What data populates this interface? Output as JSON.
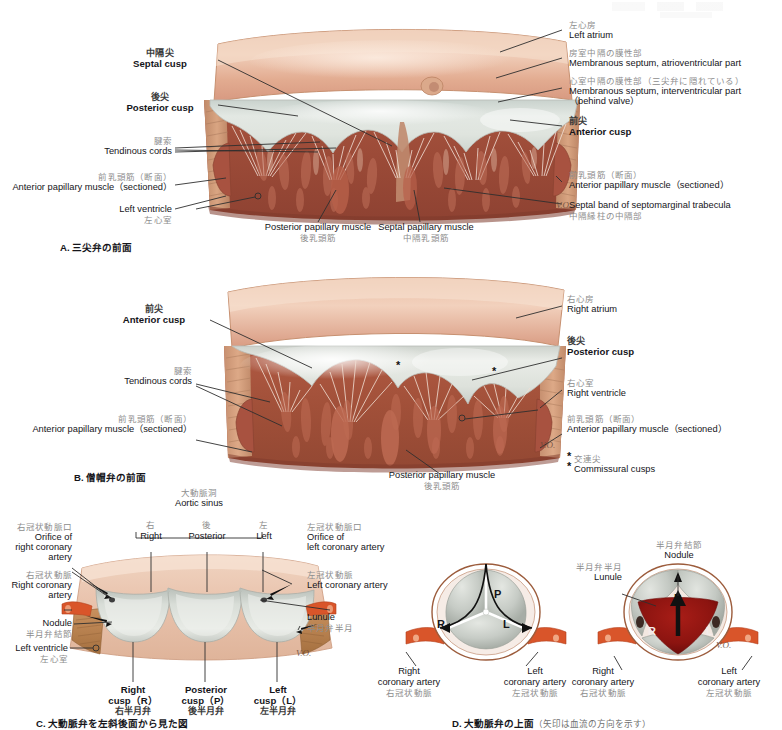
{
  "panels": {
    "a": {
      "caption_letter": "A.",
      "caption_jp": "三尖弁の前面",
      "labels": {
        "septal_cusp_jp": "中隔尖",
        "septal_cusp_en": "Septal cusp",
        "posterior_cusp_jp": "後尖",
        "posterior_cusp_en": "Posterior cusp",
        "tendinous_cords_jp": "腱索",
        "tendinous_cords_en": "Tendinous cords",
        "ant_pap_left_jp": "前乳頭筋（断面）",
        "ant_pap_left_en": "Anterior papillary muscle（sectioned）",
        "left_ventricle_en": "Left ventricle",
        "left_ventricle_jp": "左心室",
        "post_pap_en": "Posterior papillary muscle",
        "post_pap_jp": "後乳頭筋",
        "septal_pap_en": "Septal papillary muscle",
        "septal_pap_jp": "中隔乳頭筋",
        "left_atrium_jp": "左心房",
        "left_atrium_en": "Left atrium",
        "memb_av_jp": "房室中隔の膜性部",
        "memb_av_en": "Membranous septum, atrioventricular part",
        "memb_iv_jp": "心室中隔の膜性部（三尖弁に隠れている）",
        "memb_iv_en": "Membranous septum, interventricular part",
        "memb_iv_en2": "（behind valve）",
        "anterior_cusp_jp": "前尖",
        "anterior_cusp_en": "Anterior cusp",
        "ant_pap_right_jp": "前乳頭筋（断面）",
        "ant_pap_right_en": "Anterior papillary muscle（sectioned）",
        "septal_band_en": "Septal band of septomarginal trabecula",
        "septal_band_jp": "中隔縁柱の中隔部"
      }
    },
    "b": {
      "caption_letter": "B.",
      "caption_jp": "僧帽弁の前面",
      "labels": {
        "anterior_cusp_jp": "前尖",
        "anterior_cusp_en": "Anterior cusp",
        "tendinous_cords_jp": "腱索",
        "tendinous_cords_en": "Tendinous cords",
        "ant_pap_left_jp": "前乳頭筋（断面）",
        "ant_pap_left_en": "Anterior papillary muscle（sectioned）",
        "post_pap_en": "Posterior papillary muscle",
        "post_pap_jp": "後乳頭筋",
        "right_atrium_jp": "右心房",
        "right_atrium_en": "Right atrium",
        "posterior_cusp_jp": "後尖",
        "posterior_cusp_en": "Posterior cusp",
        "right_ventricle_jp": "右心室",
        "right_ventricle_en": "Right ventricle",
        "ant_pap_right_jp": "前乳頭筋（断面）",
        "ant_pap_right_en": "Anterior papillary muscle（sectioned）",
        "commissural_jp": "交連尖",
        "commissural_en": "Commissural cusps",
        "star_marks": [
          "*",
          "*"
        ]
      }
    },
    "c": {
      "caption_letter": "C.",
      "caption_jp": "大動脈弁を左斜後面から見た図",
      "labels": {
        "aortic_sinus_jp": "大動脈洞",
        "aortic_sinus_en": "Aortic sinus",
        "sinus_right_jp": "右",
        "sinus_right_en": "Right",
        "sinus_post_jp": "後",
        "sinus_post_en": "Posterior",
        "sinus_left_jp": "左",
        "sinus_left_en": "Left",
        "orifice_rca_jp": "右冠状動脈口",
        "orifice_rca_en1": "Orifice of",
        "orifice_rca_en2": "right coronary",
        "orifice_rca_en3": "artery",
        "rca_jp": "右冠状動脈",
        "rca_en1": "Right coronary",
        "rca_en2": "artery",
        "nodule_en": "Nodule",
        "nodule_jp": "半月弁結節",
        "left_ventricle_en": "Left ventricle",
        "left_ventricle_jp": "左心室",
        "orifice_lca_jp": "左冠状動脈口",
        "orifice_lca_en1": "Orifice of",
        "orifice_lca_en2": "left coronary artery",
        "lca_jp": "左冠状動脈",
        "lca_en": "Left coronary artery",
        "lunule_en": "Lunule",
        "lunule_jp": "半月弁半月",
        "right_cusp_en1": "Right",
        "right_cusp_en2": "cusp（R）",
        "right_cusp_jp": "右半月弁",
        "post_cusp_en1": "Posterior",
        "post_cusp_en2": "cusp（P）",
        "post_cusp_jp": "後半月弁",
        "left_cusp_en1": "Left",
        "left_cusp_en2": "cusp（L）",
        "left_cusp_jp": "左半月弁"
      }
    },
    "d": {
      "caption_letter": "D.",
      "caption_jp": "大動脈弁の上面",
      "caption_sub": "（矢印は血流の方向を示す）",
      "left_diagram": {
        "cusp_p": "P",
        "cusp_r": "R",
        "cusp_l": "L",
        "rca_en1": "Right",
        "rca_en2": "coronary artery",
        "rca_jp": "右冠状動脈",
        "lca_en1": "Left",
        "lca_en2": "coronary artery",
        "lca_jp": "左冠状動脈"
      },
      "right_diagram": {
        "cusp_p": "P",
        "cusp_r": "R",
        "cusp_l": "L",
        "nodule_jp": "半月弁結節",
        "nodule_en": "Nodule",
        "lunule_jp": "半月弁半月",
        "lunule_en": "Lunule",
        "rca_en1": "Right",
        "rca_en2": "coronary artery",
        "rca_jp": "右冠状動脈",
        "lca_en1": "Left",
        "lca_en2": "coronary artery",
        "lca_jp": "左冠状動脈"
      }
    }
  },
  "signature": "V.O.",
  "colors": {
    "atrium_wall": "#e5b49a",
    "valve_leaflet": "#d5dbd5",
    "myocardium_dark": "#9d4f3c",
    "myocardium_mid": "#b4634b",
    "muscle_tan": "#c88d6c",
    "chordae": "#f2ddd2",
    "coronary_red": "#d9552a",
    "blood_red": "#8c1410",
    "aorta_pale": "#e8c9b6",
    "cusp_gray": "#c4c6c1",
    "label_jp": "#8d8d8d",
    "label_en": "#15151a",
    "leader": "#2f2f2f"
  }
}
